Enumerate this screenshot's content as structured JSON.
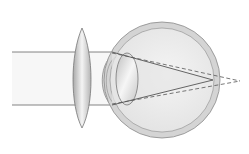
{
  "diagram": {
    "colors": {
      "background": "#ffffff",
      "eye_outer": "#d2d2d2",
      "eye_outer_stroke": "#8a8a8a",
      "eye_inner": "#ececec",
      "lens": "#c8c8c8",
      "ray": "#555555",
      "beam_fill": "#f2f2f2"
    },
    "elements": [
      {
        "name": "corrective-convex-lens",
        "label": ""
      },
      {
        "name": "eyeball",
        "label": ""
      },
      {
        "name": "eye-crystalline-lens",
        "label": ""
      },
      {
        "name": "corrected-rays",
        "style": "solid",
        "focus": "on retina"
      },
      {
        "name": "uncorrected-rays",
        "style": "dashed",
        "focus": "behind retina"
      }
    ]
  }
}
